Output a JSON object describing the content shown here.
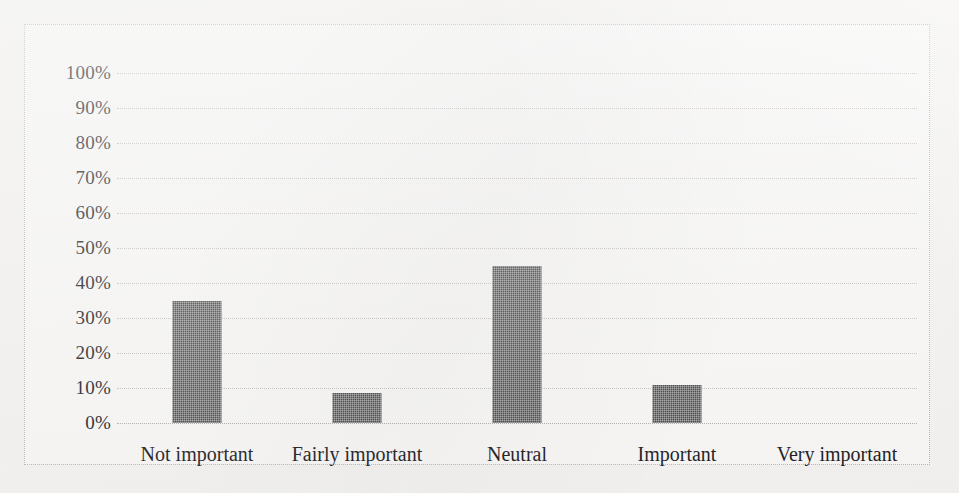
{
  "chart_data": {
    "type": "bar",
    "title": "",
    "subtitle": "",
    "xlabel": "",
    "ylabel": "",
    "categories": [
      "Not important",
      "Fairly important",
      "Neutral",
      "Important",
      "Very important"
    ],
    "values": [
      35,
      8.5,
      45,
      11,
      0
    ],
    "value_labels": [
      "35%",
      "8.5%",
      "45%",
      "11%",
      "0%"
    ],
    "ylim": [
      0,
      100
    ],
    "y_ticks": [
      0,
      10,
      20,
      30,
      40,
      50,
      60,
      70,
      80,
      90,
      100
    ],
    "y_tick_labels": [
      "0%",
      "10%",
      "20%",
      "30%",
      "40%",
      "50%",
      "60%",
      "70%",
      "80%",
      "90%",
      "100%"
    ],
    "grid": true,
    "grid_axis": "y",
    "grid_style": "dotted",
    "legend": false,
    "legend_position": "none",
    "annotations": [],
    "series": [
      {
        "name": "",
        "values": [
          35,
          8.5,
          45,
          11,
          0
        ]
      }
    ],
    "colors": {
      "bar_fill": "#3c3c3c",
      "gridline": "#c4c2bf",
      "border": "#b9b7b4",
      "plot_background": "#fbfaf9",
      "page_background": "#f6f5f3",
      "text": "#16161a"
    }
  }
}
